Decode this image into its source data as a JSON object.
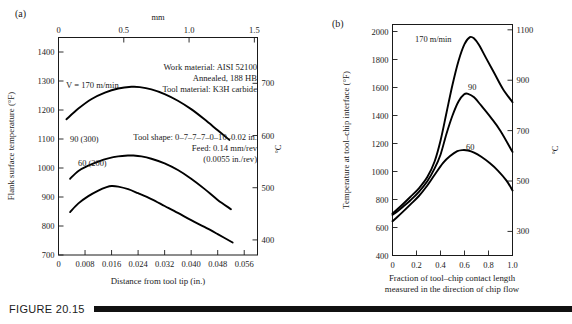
{
  "figure": {
    "caption_label": "FIGURE 20.15",
    "panel_a_label": "(a)",
    "panel_b_label": "(b)"
  },
  "chart_data": [
    {
      "id": "panel-a",
      "type": "line",
      "title": "",
      "panel": "(a)",
      "xlabel": "Distance from tool tip (in.)",
      "ylabel": "Flank surface temperature (°F)",
      "top_axis_label": "mm",
      "right_axis_label": "°C",
      "xlim": [
        0,
        0.06
      ],
      "ylim": [
        700,
        1450
      ],
      "grid": false,
      "xticks": [
        0,
        0.008,
        0.016,
        0.024,
        0.032,
        0.04,
        0.048,
        0.056
      ],
      "xticklabels": [
        "0",
        "0.008",
        "0.016",
        "0.024",
        "0.032",
        "0.040",
        "0.048",
        "0.056"
      ],
      "yticks": [
        700,
        800,
        900,
        1000,
        1100,
        1200,
        1300,
        1400
      ],
      "yticklabels": [
        "700",
        "800",
        "900",
        "1000",
        "1100",
        "1200",
        "1300",
        "1400"
      ],
      "top_ticks": [
        0,
        0.5,
        1.0,
        1.5
      ],
      "top_ticklabels": [
        "0",
        "0.5",
        "1.0",
        "1.5"
      ],
      "top_lim_mm": [
        0,
        1.524
      ],
      "right_ticks": [
        400,
        500,
        600,
        700
      ],
      "right_ticklabels": [
        "400",
        "500",
        "600",
        "700"
      ],
      "annotations": [
        "V = 170 m/min",
        "Work material:  AISI 52100",
        "Annealed, 188 HB",
        "Tool material:  K3H carbide",
        "Tool shape:  0–7–7–7–0–10–0.02 in.",
        "Feed: 0.14 mm/rev",
        "(0.0055 in./rev)"
      ],
      "series": [
        {
          "name": "170",
          "label": "V = 170 m/min",
          "x": [
            0.0024,
            0.006,
            0.01,
            0.014,
            0.018,
            0.022,
            0.0245,
            0.028,
            0.032,
            0.036,
            0.04,
            0.044,
            0.048,
            0.0515
          ],
          "y": [
            1168,
            1205,
            1238,
            1260,
            1274,
            1280,
            1279,
            1271,
            1255,
            1232,
            1203,
            1168,
            1130,
            1097
          ]
        },
        {
          "name": "90",
          "label": "90 (300)",
          "x": [
            0.0035,
            0.006,
            0.009,
            0.012,
            0.015,
            0.018,
            0.021,
            0.0225,
            0.025,
            0.028,
            0.032,
            0.036,
            0.04,
            0.044,
            0.048,
            0.052
          ],
          "y": [
            963,
            990,
            1008,
            1022,
            1033,
            1040,
            1043,
            1043,
            1040,
            1032,
            1016,
            993,
            963,
            928,
            890,
            858
          ]
        },
        {
          "name": "60",
          "label": "60 (200)",
          "x": [
            0.0035,
            0.006,
            0.009,
            0.012,
            0.0145,
            0.016,
            0.018,
            0.021,
            0.024,
            0.028,
            0.032,
            0.036,
            0.04,
            0.044,
            0.048,
            0.0525
          ],
          "y": [
            848,
            878,
            903,
            922,
            934,
            938,
            936,
            927,
            913,
            893,
            869,
            845,
            820,
            797,
            772,
            743
          ]
        }
      ]
    },
    {
      "id": "panel-b",
      "type": "line",
      "title": "",
      "panel": "(b)",
      "xlabel_line1": "Fraction of tool–chip contact length",
      "xlabel_line2": "measured in the direction of chip flow",
      "ylabel": "Temperature at tool–chip interface (°F)",
      "right_axis_label": "°C",
      "xlim": [
        0,
        1.0
      ],
      "ylim": [
        400,
        2050
      ],
      "grid": false,
      "xticks": [
        0,
        0.2,
        0.4,
        0.6,
        0.8,
        1.0
      ],
      "xticklabels": [
        "0",
        "0.2",
        "0.4",
        "0.6",
        "0.8",
        "1.0"
      ],
      "yticks": [
        400,
        600,
        800,
        1000,
        1200,
        1400,
        1600,
        1800,
        2000
      ],
      "yticklabels": [
        "400",
        "600",
        "800",
        "1000",
        "1200",
        "1400",
        "1600",
        "1800",
        "2000"
      ],
      "right_ticks": [
        300,
        500,
        700,
        900,
        1100
      ],
      "right_ticklabels": [
        "300",
        "500",
        "700",
        "900",
        "1100"
      ],
      "series": [
        {
          "name": "170",
          "label": "170 m/min",
          "x": [
            0.0,
            0.04,
            0.09,
            0.15,
            0.22,
            0.29,
            0.35,
            0.4,
            0.45,
            0.5,
            0.55,
            0.6,
            0.645,
            0.68,
            0.72,
            0.78,
            0.85,
            0.92,
            1.0
          ],
          "y": [
            700,
            730,
            770,
            820,
            880,
            960,
            1070,
            1220,
            1420,
            1620,
            1790,
            1910,
            1960,
            1950,
            1905,
            1810,
            1700,
            1590,
            1495
          ]
        },
        {
          "name": "90",
          "label": "90",
          "x": [
            0.0,
            0.04,
            0.09,
            0.15,
            0.22,
            0.29,
            0.35,
            0.4,
            0.45,
            0.5,
            0.55,
            0.595,
            0.63,
            0.68,
            0.74,
            0.82,
            0.9,
            1.0
          ],
          "y": [
            690,
            715,
            750,
            795,
            855,
            930,
            1020,
            1120,
            1270,
            1400,
            1500,
            1550,
            1555,
            1530,
            1470,
            1385,
            1290,
            1140
          ]
        },
        {
          "name": "60",
          "label": "60",
          "x": [
            0.0,
            0.04,
            0.09,
            0.15,
            0.22,
            0.29,
            0.35,
            0.42,
            0.48,
            0.54,
            0.585,
            0.63,
            0.68,
            0.74,
            0.81,
            0.88,
            0.95,
            1.0
          ],
          "y": [
            645,
            675,
            715,
            765,
            825,
            900,
            975,
            1060,
            1110,
            1145,
            1153,
            1150,
            1135,
            1105,
            1060,
            1005,
            935,
            865
          ]
        }
      ]
    }
  ]
}
